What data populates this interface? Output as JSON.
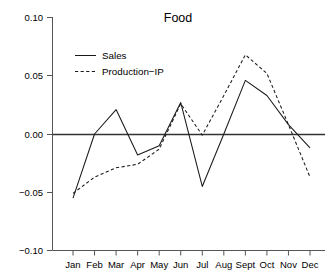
{
  "chart_data": {
    "type": "line",
    "title": "Food",
    "xlabel": "",
    "ylabel": "",
    "categories": [
      "Jan",
      "Feb",
      "Mar",
      "Apr",
      "May",
      "Jun",
      "Jul",
      "Aug",
      "Sept",
      "Oct",
      "Nov",
      "Dec"
    ],
    "ylim": [
      -0.1,
      0.1
    ],
    "ytick_labels": [
      "0.10",
      "0.05",
      "0.00",
      "-0.05",
      "-0.10"
    ],
    "yticks": [
      0.1,
      0.05,
      0.0,
      -0.05,
      -0.1
    ],
    "grid": false,
    "legend_position": "upper-left",
    "zero_reference_line": true,
    "series": [
      {
        "name": "Sales",
        "style": "solid",
        "color": "#1a1a1a",
        "values": [
          -0.055,
          0.0,
          0.021,
          -0.018,
          -0.01,
          0.027,
          -0.045,
          0.0,
          0.046,
          0.033,
          0.008,
          -0.012
        ]
      },
      {
        "name": "Production-IP",
        "style": "dashed",
        "color": "#1a1a1a",
        "values": [
          -0.051,
          -0.037,
          -0.029,
          -0.026,
          -0.013,
          0.026,
          -0.001,
          0.033,
          0.068,
          0.052,
          0.008,
          -0.037
        ]
      }
    ]
  },
  "legend": {
    "entries": [
      {
        "label": "Sales"
      },
      {
        "label": "Production−IP"
      }
    ]
  },
  "axes": {
    "y_tick_texts": [
      "0.10",
      "0.05",
      "0.00",
      "−0.05",
      "−0.10"
    ],
    "x_tick_texts": [
      "Jan",
      "Feb",
      "Mar",
      "Apr",
      "May",
      "Jun",
      "Jul",
      "Aug",
      "Sept",
      "Oct",
      "Nov",
      "Dec"
    ]
  },
  "title": {
    "text": "Food"
  }
}
